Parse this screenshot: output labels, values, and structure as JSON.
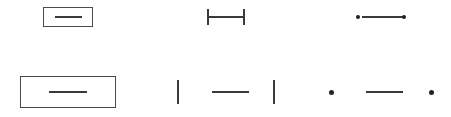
{
  "figure": {
    "width": 451,
    "height": 117,
    "background_color": "#ffffff",
    "stroke_color": "#3a3a3a",
    "accent_color": "#555555",
    "dot_color": "#222222",
    "rows": [
      {
        "label": "small-scale-row",
        "row_index": 1
      },
      {
        "label": "large-scale-row",
        "row_index": 2
      }
    ],
    "columns": [
      {
        "label": "boxed-line-column",
        "column_index": 1
      },
      {
        "label": "tick-bounded-line-column",
        "column_index": 2
      },
      {
        "label": "dot-bounded-line-column",
        "column_index": 3
      }
    ]
  },
  "glyphs": [
    {
      "id": "boxed-line-small",
      "type": "rect-with-inner-line",
      "row": 1,
      "column": 1,
      "rect": {
        "x": 43,
        "y": 7,
        "width": 50,
        "height": 20,
        "border_width": 1,
        "color": "#4a4a4a"
      },
      "line": {
        "x": 55,
        "y": 17,
        "length": 27,
        "thickness": 2,
        "color": "#3a3a3a"
      }
    },
    {
      "id": "tick-bounded-line-small",
      "type": "line-with-end-ticks",
      "row": 1,
      "column": 2,
      "line": {
        "x": 209,
        "y": 17,
        "length": 34,
        "thickness": 2,
        "color": "#3a3a3a"
      },
      "ticks": [
        {
          "x": 207,
          "y": 9,
          "height": 16,
          "thickness": 2,
          "color": "#3a3a3a"
        },
        {
          "x": 243,
          "y": 9,
          "height": 16,
          "thickness": 2,
          "color": "#3a3a3a"
        }
      ]
    },
    {
      "id": "dot-bounded-line-small",
      "type": "line-with-end-dots",
      "row": 1,
      "column": 3,
      "line": {
        "x": 362,
        "y": 17,
        "length": 41,
        "thickness": 2,
        "color": "#3a3a3a"
      },
      "dots": [
        {
          "x": 358,
          "y": 17,
          "diameter": 4,
          "color": "#222222"
        },
        {
          "x": 404,
          "y": 17,
          "diameter": 4,
          "color": "#222222"
        }
      ]
    },
    {
      "id": "boxed-line-large",
      "type": "rect-with-inner-line",
      "row": 2,
      "column": 1,
      "rect": {
        "x": 20,
        "y": 76,
        "width": 96,
        "height": 32,
        "border_width": 1,
        "color": "#4a4a4a"
      },
      "line": {
        "x": 49,
        "y": 92,
        "length": 38,
        "thickness": 2,
        "color": "#3a3a3a"
      }
    },
    {
      "id": "tick-bounded-line-large",
      "type": "detached-line-with-outer-ticks",
      "row": 2,
      "column": 2,
      "line": {
        "x": 212,
        "y": 92,
        "length": 37,
        "thickness": 2,
        "color": "#3a3a3a"
      },
      "ticks": [
        {
          "x": 177,
          "y": 80,
          "height": 24,
          "thickness": 2,
          "color": "#3a3a3a"
        },
        {
          "x": 273,
          "y": 80,
          "height": 24,
          "thickness": 2,
          "color": "#3a3a3a"
        }
      ]
    },
    {
      "id": "dot-bounded-line-large",
      "type": "detached-line-with-outer-dots",
      "row": 2,
      "column": 3,
      "line": {
        "x": 366,
        "y": 92,
        "length": 37,
        "thickness": 2,
        "color": "#3a3a3a"
      },
      "dots": [
        {
          "x": 331,
          "y": 92,
          "diameter": 5,
          "color": "#222222"
        },
        {
          "x": 431,
          "y": 92,
          "diameter": 5,
          "color": "#222222"
        }
      ]
    }
  ]
}
